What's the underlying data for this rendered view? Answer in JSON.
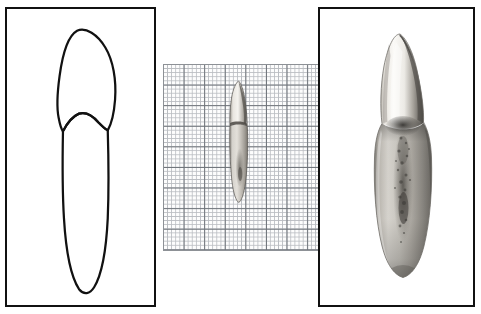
{
  "figure": {
    "background_color": "#ffffff",
    "frame_color": "#111111",
    "width": 481,
    "height": 314
  },
  "panels": [
    {
      "id": "drawing",
      "name": "tooth-line-drawing-panel",
      "kind": "line-drawing",
      "framed": true,
      "label": "",
      "content_label": "Outline drawing of single-rooted tooth (labial view)",
      "stroke_color": "#111111",
      "fill_color": "#ffffff",
      "x": 5,
      "y": 7,
      "width": 151,
      "height": 300
    },
    {
      "id": "scale",
      "name": "tooth-on-graph-paper-panel",
      "kind": "photograph-on-grid",
      "framed": false,
      "label": "",
      "content_label": "Photograph of tooth against millimetre graph paper for scale",
      "x": 163,
      "y": 64,
      "width": 157,
      "height": 187
    },
    {
      "id": "enlarged",
      "name": "tooth-photograph-panel",
      "kind": "photograph",
      "framed": true,
      "label": "",
      "content_label": "Enlarged greyscale photograph of tooth (labial view)",
      "x": 318,
      "y": 7,
      "width": 157,
      "height": 300
    }
  ],
  "graph_paper": {
    "name": "graph-paper-grid",
    "minor_cell_px": 4.12,
    "major_cell_px": 20.6,
    "minor_per_major": 5,
    "minor_line_color": "#b9bcc1",
    "major_line_color": "#6e7379",
    "paper_color": "#fdfdfd"
  },
  "specimen": {
    "name": "tooth-specimen",
    "type": "single-rooted tooth",
    "parts": [
      {
        "name": "crown",
        "note": "pointed cusp inclined distally"
      },
      {
        "name": "cervical-line",
        "note": "curved enamel-cementum junction"
      },
      {
        "name": "root",
        "note": "long tapering root with rounded apex"
      }
    ],
    "palette": {
      "enamel_light": "#f2f0ec",
      "enamel_mid": "#cfcbc4",
      "dentine_shadow": "#8e8a83",
      "dark_groove": "#3c3a36",
      "outline": "#2b2926"
    }
  }
}
